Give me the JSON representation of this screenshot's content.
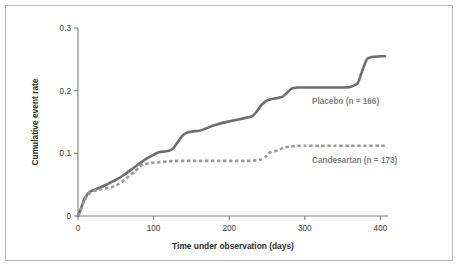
{
  "figure": {
    "background_color": "#ffffff",
    "border_color": "#b9b9b9"
  },
  "chart_data": {
    "type": "line",
    "title": "",
    "subtitle": "",
    "xlabel": "Time under observation (days)",
    "ylabel": "Cumulative event rate",
    "xlim": [
      0,
      410
    ],
    "ylim": [
      0,
      0.3
    ],
    "xticks": [
      0,
      100,
      200,
      300,
      400
    ],
    "xtick_labels": [
      "0",
      "100",
      "200",
      "300",
      "400"
    ],
    "yticks": [
      0,
      0.1,
      0.2,
      0.3
    ],
    "ytick_labels": [
      "0",
      "0.1",
      "0.2",
      "0.3"
    ],
    "grid": false,
    "legend_position": "inline-annotation",
    "annotations": [
      {
        "text": "Placebo (n = 166)",
        "x": 300,
        "y": 0.185,
        "color": "#808080"
      },
      {
        "text": "Candesartan (n = 173)",
        "x": 300,
        "y": 0.078,
        "color": "#9a9a9a"
      }
    ],
    "series": [
      {
        "name": "Placebo (n = 166)",
        "label": "Placebo (n = 166)",
        "style": "solid",
        "color": "#6e6e6e",
        "n": 166,
        "x": [
          0,
          4,
          8,
          12,
          16,
          22,
          28,
          36,
          44,
          52,
          60,
          68,
          76,
          84,
          90,
          96,
          102,
          108,
          114,
          120,
          126,
          132,
          138,
          144,
          152,
          160,
          168,
          176,
          184,
          192,
          200,
          208,
          216,
          224,
          230,
          236,
          242,
          248,
          254,
          262,
          270,
          276,
          282,
          290,
          300,
          315,
          330,
          345,
          360,
          370,
          376,
          382,
          390,
          400,
          406
        ],
        "y": [
          0.0,
          0.012,
          0.026,
          0.034,
          0.039,
          0.042,
          0.045,
          0.049,
          0.054,
          0.059,
          0.065,
          0.072,
          0.079,
          0.086,
          0.091,
          0.095,
          0.099,
          0.102,
          0.103,
          0.104,
          0.108,
          0.118,
          0.128,
          0.133,
          0.135,
          0.136,
          0.139,
          0.143,
          0.146,
          0.149,
          0.151,
          0.153,
          0.155,
          0.157,
          0.159,
          0.166,
          0.176,
          0.183,
          0.186,
          0.188,
          0.19,
          0.196,
          0.203,
          0.205,
          0.205,
          0.205,
          0.205,
          0.205,
          0.206,
          0.212,
          0.232,
          0.25,
          0.254,
          0.255,
          0.255
        ]
      },
      {
        "name": "Candesartan (n = 173)",
        "label": "Candesartan (n = 173)",
        "style": "dashed",
        "color": "#9a9a9a",
        "n": 173,
        "x": [
          0,
          4,
          8,
          12,
          16,
          22,
          28,
          36,
          44,
          52,
          58,
          64,
          70,
          76,
          82,
          88,
          94,
          100,
          108,
          118,
          128,
          140,
          152,
          164,
          176,
          188,
          200,
          212,
          222,
          230,
          236,
          242,
          248,
          252,
          256,
          260,
          264,
          268,
          272,
          276,
          282,
          290,
          300,
          320,
          340,
          360,
          380,
          400,
          406
        ],
        "y": [
          0.0,
          0.011,
          0.024,
          0.032,
          0.037,
          0.04,
          0.042,
          0.044,
          0.046,
          0.05,
          0.054,
          0.06,
          0.066,
          0.072,
          0.079,
          0.083,
          0.084,
          0.085,
          0.086,
          0.087,
          0.088,
          0.088,
          0.088,
          0.088,
          0.088,
          0.088,
          0.088,
          0.088,
          0.088,
          0.088,
          0.089,
          0.09,
          0.094,
          0.1,
          0.102,
          0.103,
          0.105,
          0.107,
          0.109,
          0.11,
          0.111,
          0.112,
          0.112,
          0.112,
          0.112,
          0.112,
          0.112,
          0.112,
          0.112
        ]
      }
    ]
  }
}
